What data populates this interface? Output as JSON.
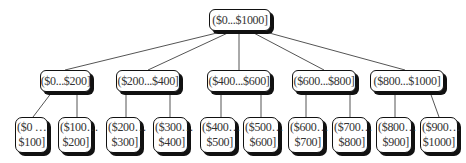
{
  "diagram": {
    "type": "tree",
    "root": {
      "label": "($0...$1000]"
    },
    "level2": [
      {
        "label": "($0...$200]"
      },
      {
        "label": "($200...$400]"
      },
      {
        "label": "($400...$600]"
      },
      {
        "label": "($600...$800]"
      },
      {
        "label": "($800...$1000]"
      }
    ],
    "level3": [
      {
        "line1": "($0 …",
        "line2": "$100]"
      },
      {
        "line1": "($100…",
        "line2": "$200]"
      },
      {
        "line1": "($200…",
        "line2": "$300]"
      },
      {
        "line1": "($300…",
        "line2": "$400]"
      },
      {
        "line1": "($400…",
        "line2": "$500]"
      },
      {
        "line1": "($500…",
        "line2": "$600]"
      },
      {
        "line1": "($600…",
        "line2": "$700]"
      },
      {
        "line1": "($700…",
        "line2": "$800]"
      },
      {
        "line1": "($800…",
        "line2": "$900]"
      },
      {
        "line1": "($900…",
        "line2": "$1000]"
      }
    ],
    "colors": {
      "border": "#111111",
      "shadow": "#111111",
      "edge": "#555555",
      "text": "#333333",
      "background": "#ffffff"
    }
  }
}
